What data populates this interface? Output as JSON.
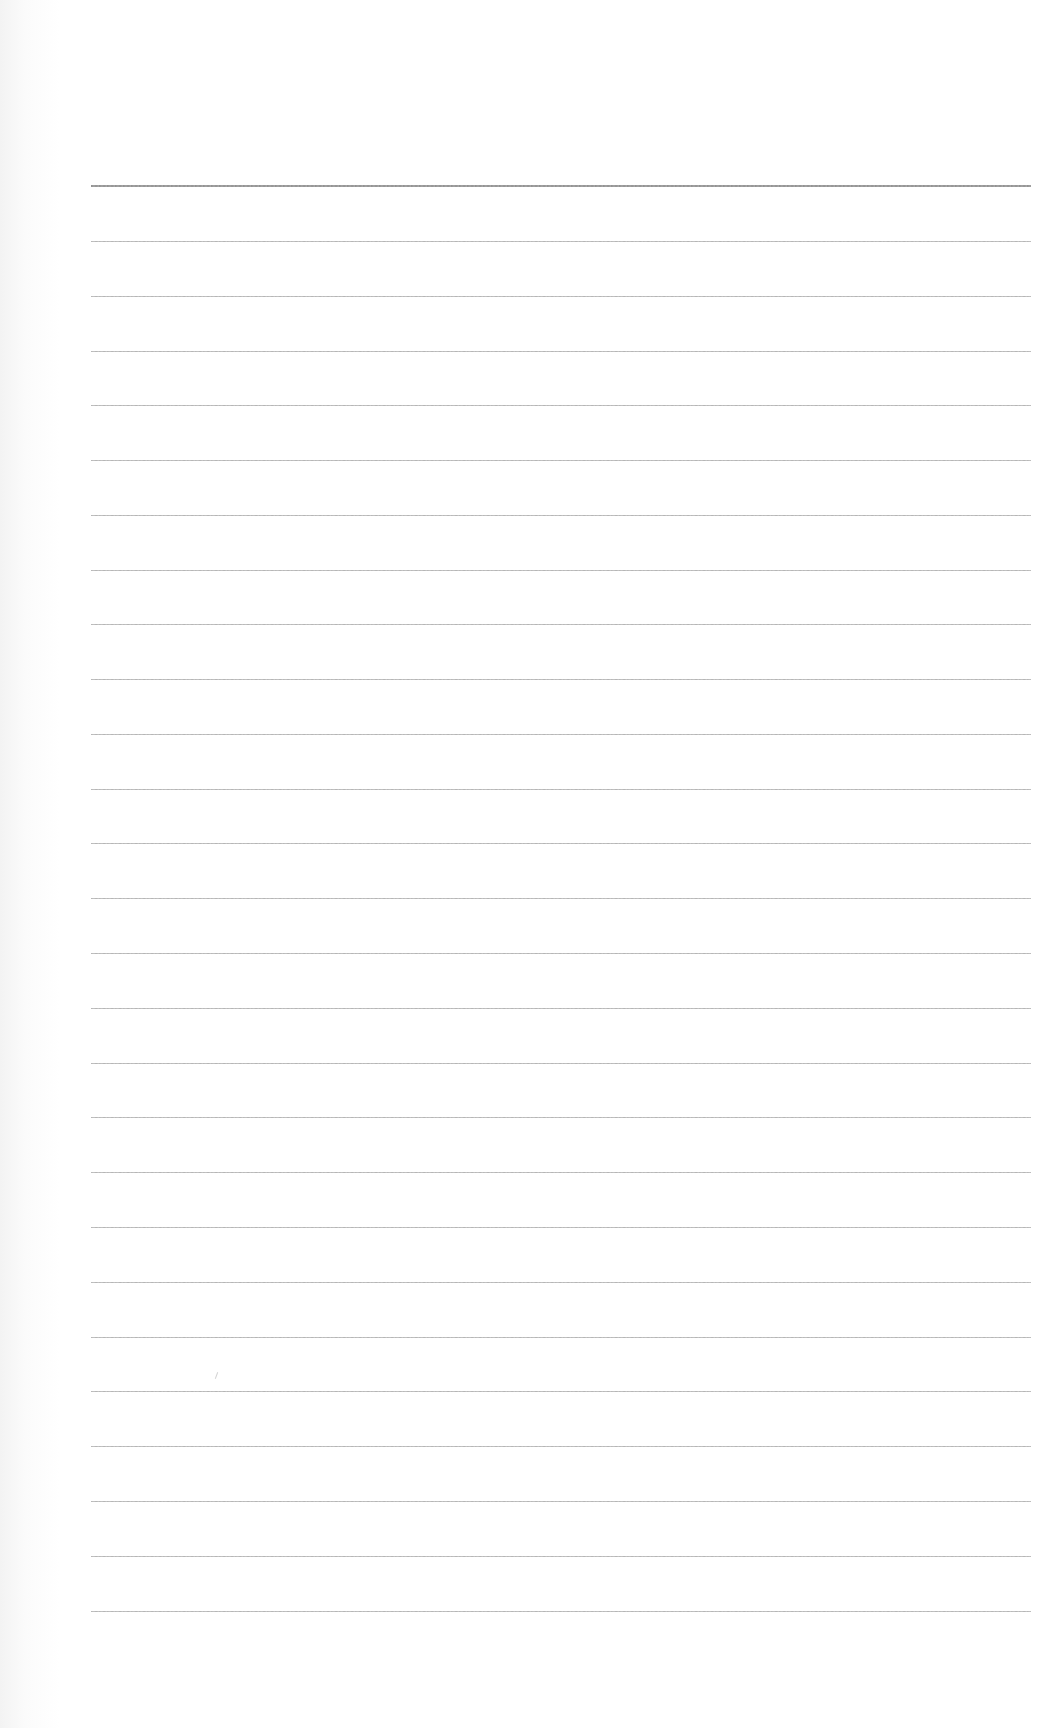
{
  "document": {
    "type": "blank lined paper",
    "background_color": "#ffffff",
    "line_color": "#a8a8a8",
    "header_line_color": "#959595",
    "line_count": 27,
    "line_left_px": 91,
    "line_right_px": 1031,
    "line_positions_y": [
      186,
      241,
      296,
      351,
      405,
      460,
      515,
      570,
      624,
      679,
      734,
      789,
      843,
      898,
      953,
      1008,
      1063,
      1117,
      1172,
      1227,
      1282,
      1337,
      1391,
      1446,
      1501,
      1556,
      1611
    ],
    "text_content": ""
  }
}
